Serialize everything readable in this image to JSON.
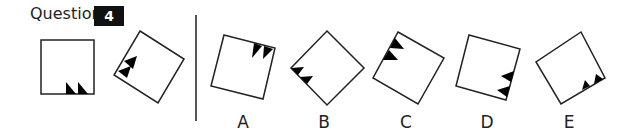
{
  "question": {
    "label": "Question",
    "number": "4"
  },
  "stimulus": [
    {
      "id": "source",
      "corners": [
        [
          41,
          40
        ],
        [
          94,
          40
        ],
        [
          94,
          94
        ],
        [
          41,
          94
        ]
      ],
      "triangles": [
        [
          [
            66,
            94
          ],
          [
            76,
            94
          ],
          [
            66,
            82
          ]
        ],
        [
          [
            78,
            94
          ],
          [
            88,
            94
          ],
          [
            78,
            82
          ]
        ]
      ]
    },
    {
      "id": "rotated-example",
      "corners": [
        [
          140,
          31
        ],
        [
          184,
          59
        ],
        [
          158,
          103
        ],
        [
          114,
          75
        ]
      ],
      "triangles": [
        [
          [
            124,
            61
          ],
          [
            133,
            69
          ],
          [
            137,
            56
          ]
        ],
        [
          [
            118,
            71
          ],
          [
            127,
            78
          ],
          [
            131,
            66
          ]
        ]
      ]
    }
  ],
  "options": [
    {
      "label": "A",
      "label_x": 243,
      "corners": [
        [
          224,
          35
        ],
        [
          275,
          48
        ],
        [
          263,
          99
        ],
        [
          211,
          86
        ]
      ],
      "triangles": [
        [
          [
            254,
            43
          ],
          [
            262,
            46
          ],
          [
            252,
            58
          ]
        ],
        [
          [
            264,
            46
          ],
          [
            273,
            49
          ],
          [
            263,
            59
          ]
        ]
      ]
    },
    {
      "label": "B",
      "label_x": 324,
      "corners": [
        [
          327,
          31
        ],
        [
          364,
          68
        ],
        [
          327,
          105
        ],
        [
          291,
          68
        ]
      ],
      "triangles": [
        [
          [
            291,
            68
          ],
          [
            298,
            75
          ],
          [
            304,
            67
          ]
        ],
        [
          [
            300,
            77
          ],
          [
            307,
            84
          ],
          [
            313,
            76
          ]
        ]
      ]
    },
    {
      "label": "C",
      "label_x": 406,
      "corners": [
        [
          398,
          32
        ],
        [
          444,
          58
        ],
        [
          418,
          104
        ],
        [
          373,
          78
        ]
      ],
      "triangles": [
        [
          [
            395,
            38
          ],
          [
            390,
            48
          ],
          [
            404,
            49
          ]
        ],
        [
          [
            389,
            50
          ],
          [
            383,
            60
          ],
          [
            398,
            60
          ]
        ]
      ]
    },
    {
      "label": "D",
      "label_x": 487,
      "corners": [
        [
          469,
          35
        ],
        [
          520,
          49
        ],
        [
          506,
          100
        ],
        [
          456,
          86
        ]
      ],
      "triangles": [
        [
          [
            514,
            71
          ],
          [
            511,
            82
          ],
          [
            501,
            76
          ]
        ],
        [
          [
            510,
            86
          ],
          [
            507,
            97
          ],
          [
            497,
            90
          ]
        ]
      ]
    },
    {
      "label": "E",
      "label_x": 569,
      "corners": [
        [
          581,
          32
        ],
        [
          605,
          78
        ],
        [
          561,
          104
        ],
        [
          536,
          62
        ]
      ],
      "triangles": [
        [
          [
            582,
            90
          ],
          [
            590,
            86
          ],
          [
            585,
            80
          ]
        ],
        [
          [
            594,
            84
          ],
          [
            603,
            79
          ],
          [
            596,
            74
          ]
        ]
      ]
    }
  ],
  "colors": {
    "stroke": "#222222",
    "fill": "#000000",
    "number_bg": "#111111"
  }
}
